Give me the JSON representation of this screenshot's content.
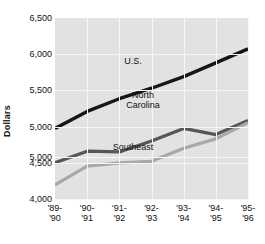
{
  "chart_data": {
    "type": "line",
    "title": "",
    "xlabel": "",
    "ylabel": "Dollars",
    "ylim": [
      4000,
      6500
    ],
    "ytick_labels": [
      "6,500",
      "6,000",
      "5,500",
      "5,000",
      "5,000",
      "4,500",
      "4,000"
    ],
    "ytick_values": [
      6500,
      6000,
      5500,
      5000,
      4583,
      4500,
      4000
    ],
    "grid": true,
    "legend_position": "inline-labels",
    "categories": [
      "'89-'90",
      "'90-'91",
      "'91-'92",
      "'92-'93",
      "'93-'94",
      "'94-'95",
      "'95-'96"
    ],
    "categories_lines": [
      [
        "'89-",
        "'90"
      ],
      [
        "'90-",
        "'91"
      ],
      [
        "'91-",
        "'92"
      ],
      [
        "'92-",
        "'93"
      ],
      [
        "'93-",
        "'94"
      ],
      [
        "'94-",
        "'95"
      ],
      [
        "'95-",
        "'96"
      ]
    ],
    "series": [
      {
        "name": "U.S.",
        "color": "#161616",
        "width": 3.4,
        "values": [
          4975,
          5210,
          5385,
          5530,
          5690,
          5880,
          6075
        ],
        "label_position": "above-line"
      },
      {
        "name": "North Carolina",
        "color": "#565656",
        "width": 3.2,
        "values": [
          4500,
          4660,
          4650,
          4800,
          4975,
          4890,
          5085
        ],
        "label_position": "above-line"
      },
      {
        "name": "Southeast",
        "color": "#a8a8a8",
        "width": 3.2,
        "values": [
          4195,
          4455,
          4500,
          4520,
          4700,
          4830,
          5055
        ],
        "label_position": "above-line"
      }
    ],
    "colors": {
      "plot_background": "#e2e2e2",
      "gridline": "#f7f7f7",
      "page_background": "#ffffff",
      "text": "#111111"
    }
  },
  "axis": {
    "y_title": "Dollars"
  },
  "title_remnant": "",
  "series_labels": {
    "us": "U.S.",
    "north_carolina_line1": "North",
    "north_carolina_line2": "Carolina",
    "southeast": "Southeast"
  }
}
